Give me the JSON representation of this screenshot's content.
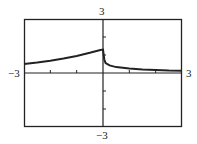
{
  "chart_data": {
    "type": "line",
    "title": "",
    "xlabel": "",
    "ylabel": "",
    "xlim": [
      -3,
      3
    ],
    "ylim": [
      -3,
      3
    ],
    "grid": false,
    "tick_labels": {
      "x_min": "-3",
      "x_max": "3",
      "y_min": "-3",
      "y_max": "3"
    },
    "x_ticks": [
      -2,
      -1,
      0,
      1,
      2
    ],
    "y_ticks": [
      -2,
      -1,
      0,
      1,
      2
    ],
    "series": [
      {
        "name": "f(x)",
        "x": [
          -3,
          -2.5,
          -2,
          -1.5,
          -1,
          -0.5,
          -0.1,
          0,
          0.05,
          0.1,
          0.25,
          0.5,
          1,
          1.5,
          2,
          2.5,
          3
        ],
        "values": [
          0.5,
          0.58,
          0.68,
          0.8,
          0.95,
          1.12,
          1.28,
          1.3,
          0.75,
          0.55,
          0.42,
          0.33,
          0.25,
          0.2,
          0.17,
          0.14,
          0.12
        ]
      }
    ]
  },
  "labels": {
    "left": "−3",
    "right": "3",
    "top": "3",
    "bottom": "−3"
  }
}
